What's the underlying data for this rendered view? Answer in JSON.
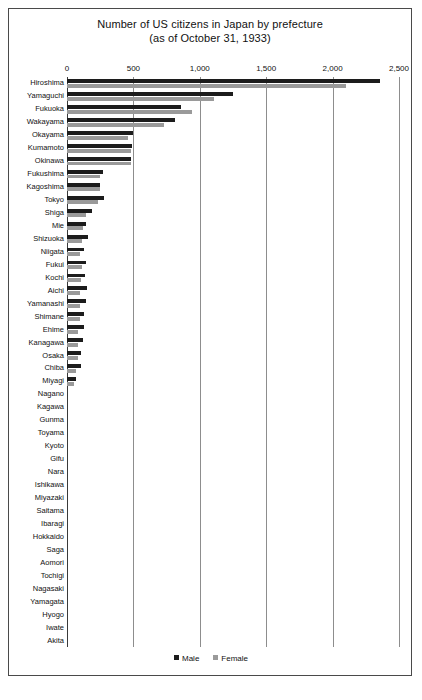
{
  "chart_data": {
    "type": "bar",
    "orientation": "horizontal",
    "title": "Number of US citizens in Japan by prefecture",
    "subtitle": "(as of October 31, 1933)",
    "xlabel": "",
    "ylabel": "",
    "xlim": [
      0,
      2500
    ],
    "xticks": [
      0,
      500,
      1000,
      1500,
      2000,
      2500
    ],
    "xtick_labels": [
      "0",
      "500",
      "1,000",
      "1,500",
      "2,000",
      "2,500"
    ],
    "grid": true,
    "legend_position": "bottom",
    "categories": [
      "Hiroshima",
      "Yamaguchi",
      "Fukuoka",
      "Wakayama",
      "Okayama",
      "Kumamoto",
      "Okinawa",
      "Fukushima",
      "Kagoshima",
      "Tokyo",
      "Shiga",
      "Mie",
      "Shizuoka",
      "Niigata",
      "Fukui",
      "Kochi",
      "Aichi",
      "Yamanashi",
      "Shimane",
      "Ehime",
      "Kanagawa",
      "Osaka",
      "Chiba",
      "Miyagi",
      "Nagano",
      "Kagawa",
      "Gunma",
      "Toyama",
      "Kyoto",
      "Gifu",
      "Nara",
      "Ishikawa",
      "Miyazaki",
      "Saitama",
      "Ibaragi",
      "Hokkaido",
      "Saga",
      "Aomori",
      "Tochigi",
      "Nagasaki",
      "Yamagata",
      "Hyogo",
      "Iwate",
      "Akita"
    ],
    "series": [
      {
        "name": "Male",
        "color": "#1c1c1c",
        "values": [
          2360,
          1250,
          860,
          810,
          500,
          490,
          485,
          270,
          250,
          280,
          185,
          145,
          155,
          130,
          140,
          135,
          150,
          140,
          130,
          130,
          120,
          105,
          105,
          70,
          0,
          0,
          0,
          0,
          0,
          0,
          0,
          0,
          0,
          0,
          0,
          0,
          0,
          0,
          0,
          0,
          0,
          0,
          0,
          0
        ]
      },
      {
        "name": "Female",
        "color": "#9a9a9a",
        "values": [
          2100,
          1110,
          940,
          730,
          460,
          480,
          480,
          250,
          250,
          230,
          140,
          120,
          110,
          100,
          110,
          105,
          100,
          95,
          95,
          80,
          85,
          80,
          65,
          50,
          0,
          0,
          0,
          0,
          0,
          0,
          0,
          0,
          0,
          0,
          0,
          0,
          0,
          0,
          0,
          0,
          0,
          0,
          0,
          0
        ]
      }
    ],
    "legend": [
      "Male",
      "Female"
    ]
  }
}
